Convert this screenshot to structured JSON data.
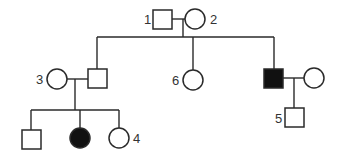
{
  "diagram": {
    "type": "pedigree",
    "colors": {
      "line": "#2a2a2a",
      "affected_fill": "#111111",
      "unaffected_fill": "#ffffff"
    },
    "individuals": [
      {
        "id": "1",
        "label": "1",
        "sex": "male",
        "affected": false,
        "generation": 1
      },
      {
        "id": "2",
        "label": "2",
        "sex": "female",
        "affected": false,
        "generation": 1
      },
      {
        "id": "3",
        "label": "3",
        "sex": "female",
        "affected": false,
        "generation": 2
      },
      {
        "id": "II-husband",
        "label": "",
        "sex": "male",
        "affected": false,
        "generation": 2
      },
      {
        "id": "6",
        "label": "6",
        "sex": "female",
        "affected": false,
        "generation": 2
      },
      {
        "id": "II-affected-male",
        "label": "",
        "sex": "male",
        "affected": true,
        "generation": 2
      },
      {
        "id": "II-spouse-right",
        "label": "",
        "sex": "female",
        "affected": false,
        "generation": 2
      },
      {
        "id": "III-son",
        "label": "",
        "sex": "male",
        "affected": false,
        "generation": 3
      },
      {
        "id": "III-affected-daughter",
        "label": "",
        "sex": "female",
        "affected": true,
        "generation": 3
      },
      {
        "id": "4",
        "label": "4",
        "sex": "female",
        "affected": false,
        "generation": 3
      },
      {
        "id": "5",
        "label": "5",
        "sex": "male",
        "affected": false,
        "generation": 3
      }
    ],
    "labels": {
      "l1": "1",
      "l2": "2",
      "l3": "3",
      "l4": "4",
      "l5": "5",
      "l6": "6"
    }
  }
}
